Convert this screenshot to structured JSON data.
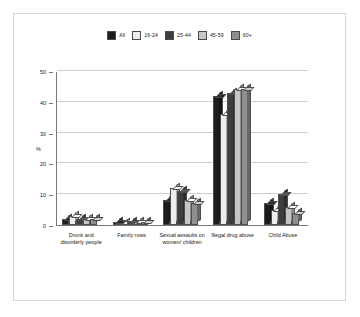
{
  "chart_data": {
    "type": "bar",
    "title": "",
    "xlabel": "",
    "ylabel": "%",
    "ylim": [
      0,
      50
    ],
    "yticks": [
      0,
      10,
      20,
      30,
      40,
      50
    ],
    "grid": true,
    "legend_position": "top",
    "style": "3d-grouped-column",
    "categories": [
      "Drunk and disorderly people",
      "Family rows",
      "Sexual assaults on women/ children",
      "Illegal drug abuse",
      "Child Abuse"
    ],
    "series": [
      {
        "name": "All",
        "color": "#1c1c1c",
        "values": [
          2,
          1,
          8,
          42,
          7
        ]
      },
      {
        "name": "16-24",
        "color": "#ededed",
        "values": [
          3,
          0,
          12,
          36,
          5
        ]
      },
      {
        "name": "25-44",
        "color": "#3d3d3d",
        "values": [
          2,
          1,
          11,
          43,
          10
        ]
      },
      {
        "name": "45-59",
        "color": "#c6c6c6",
        "values": [
          2,
          1,
          8,
          44,
          6
        ]
      },
      {
        "name": "60+",
        "color": "#8f8f8f",
        "values": [
          2,
          1,
          7,
          44,
          4
        ]
      }
    ]
  },
  "colors": {
    "frame": "#d8d8d8",
    "axis": "#777777",
    "gridline": "#cfcfcf",
    "background": "#ffffff"
  }
}
